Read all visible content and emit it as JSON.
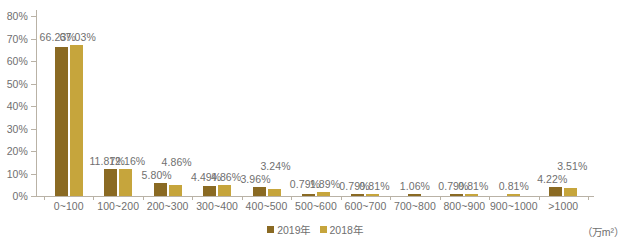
{
  "chart_data": {
    "type": "bar",
    "title": "",
    "subtitle": "",
    "xlabel": "（万m²）",
    "ylabel": "",
    "ylim": [
      0,
      80
    ],
    "ytick_labels": [
      "0%",
      "10%",
      "20%",
      "30%",
      "40%",
      "50%",
      "60%",
      "70%",
      "80%"
    ],
    "ytick_values": [
      0,
      10,
      20,
      30,
      40,
      50,
      60,
      70,
      80
    ],
    "grid": false,
    "legend_position": "bottom-center",
    "categories": [
      "0~100",
      "100~200",
      "200~300",
      "300~400",
      "400~500",
      "500~600",
      "600~700",
      "700~800",
      "800~900",
      "900~1000",
      ">1000"
    ],
    "series": [
      {
        "name": "2019年",
        "color": "#8a6a23",
        "values": [
          66.23,
          11.87,
          5.8,
          4.49,
          3.96,
          0.79,
          0.79,
          1.06,
          0.79,
          0,
          4.22
        ],
        "labels": [
          "66.23%",
          "11.87%",
          "5.80%",
          "4.49%",
          "3.96%",
          "0.79%",
          "0.79%",
          "1.06%",
          "0.79%",
          "",
          "4.22%"
        ]
      },
      {
        "name": "2018年",
        "color": "#c6a53c",
        "values": [
          67.03,
          12.16,
          4.86,
          4.86,
          3.24,
          1.89,
          0.81,
          0,
          0.81,
          0.81,
          3.51
        ],
        "labels": [
          "67.03%",
          "12.16%",
          "4.86%",
          "4.86%",
          "3.24%",
          "1.89%",
          "0.81%",
          "",
          "0.81%",
          "0.81%",
          "3.51%"
        ]
      }
    ]
  },
  "axis": {
    "unit_label": "（万m²）"
  },
  "legend": {
    "items": [
      {
        "label": "2019年",
        "color": "#8a6a23"
      },
      {
        "label": "2018年",
        "color": "#c6a53c"
      }
    ]
  },
  "colors": {
    "series_2019": "#8a6a23",
    "series_2018": "#c6a53c",
    "axis": "#b9b2a6",
    "text": "#6f6f6f",
    "background": "#ffffff"
  }
}
